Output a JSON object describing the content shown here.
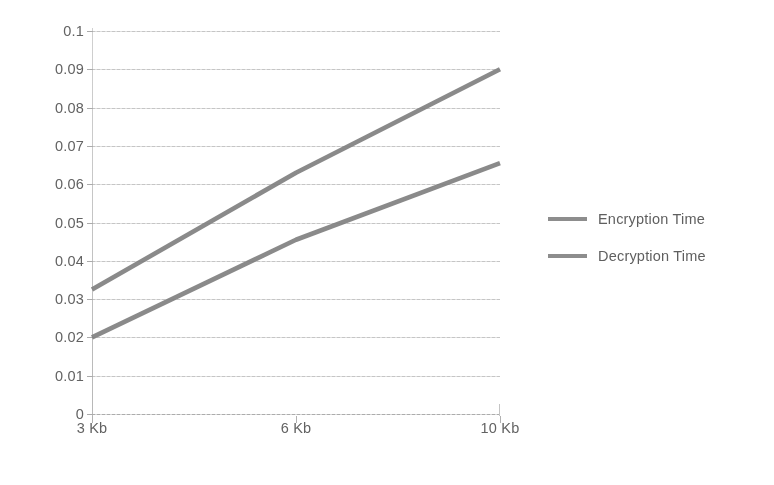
{
  "chart_data": {
    "type": "line",
    "title": "",
    "subtitle": "",
    "xlabel": "",
    "ylabel": "",
    "categories": [
      "3 Kb",
      "6 Kb",
      "10 Kb"
    ],
    "series": [
      {
        "name": "Encryption Time",
        "values": [
          0.0325,
          0.063,
          0.09
        ],
        "color": "#7c7c7c"
      },
      {
        "name": "Decryption Time",
        "values": [
          0.02,
          0.0455,
          0.0655
        ],
        "color": "#7c7c7c"
      }
    ],
    "ylim": [
      0,
      0.1
    ],
    "y_ticks": [
      "0.1",
      "0.09",
      "0.08",
      "0.07",
      "0.06",
      "0.05",
      "0.04",
      "0.03",
      "0.02",
      "0.01",
      "0"
    ],
    "y_tick_values": [
      0.1,
      0.09,
      0.08,
      0.07,
      0.06,
      0.05,
      0.04,
      0.03,
      0.02,
      0.01,
      0
    ],
    "grid": true,
    "grid_axis": "y",
    "legend_position": "right",
    "annotations": []
  },
  "legend": {
    "items": [
      {
        "label": "Encryption Time"
      },
      {
        "label": "Decryption Time"
      }
    ]
  }
}
